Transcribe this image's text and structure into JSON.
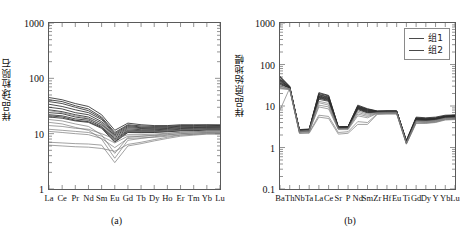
{
  "figure": {
    "panels": [
      {
        "id": "a",
        "caption": "(a)",
        "ylabel": "样品/球粒陨石"
      },
      {
        "id": "b",
        "caption": "(b)",
        "ylabel": "样品/原始地幔"
      }
    ],
    "legend": {
      "items": [
        {
          "label": "组1",
          "color": "#3d3d3d"
        },
        {
          "label": "组2",
          "color": "#6b6b6b"
        }
      ]
    }
  },
  "chart_data": [
    {
      "type": "line",
      "panel": "a",
      "title": "",
      "xlabel": "",
      "ylabel": "样品/球粒陨石",
      "yscale": "log",
      "ylim": [
        1,
        1000
      ],
      "yticks": [
        1,
        10,
        100,
        1000
      ],
      "ytick_labels": [
        "1",
        "10",
        "100",
        "1000"
      ],
      "grid": false,
      "legend_position": "none",
      "categories": [
        "La",
        "Ce",
        "Pr",
        "Nd",
        "Sm",
        "Eu",
        "Gd",
        "Tb",
        "Dy",
        "Ho",
        "Er",
        "Tm",
        "Yb",
        "Lu"
      ],
      "series": [
        {
          "name": "s1",
          "group": "组1",
          "values": [
            45,
            41,
            35,
            31,
            22,
            11.5,
            15.5,
            14.5,
            14.0,
            14.0,
            14.5,
            14.5,
            14.5,
            14.5
          ]
        },
        {
          "name": "s2",
          "group": "组1",
          "values": [
            41,
            38,
            32,
            28,
            20,
            10.5,
            14.5,
            13.8,
            13.5,
            13.6,
            14.0,
            14.0,
            14.2,
            14.0
          ]
        },
        {
          "name": "s3",
          "group": "组1",
          "values": [
            38,
            35,
            30,
            26,
            19,
            10.0,
            14.0,
            13.2,
            13.0,
            13.2,
            13.6,
            13.6,
            13.8,
            13.8
          ]
        },
        {
          "name": "s4",
          "group": "组1",
          "values": [
            34,
            31,
            27,
            24,
            18,
            9.5,
            13.4,
            12.8,
            12.6,
            12.8,
            13.2,
            13.2,
            13.4,
            13.4
          ]
        },
        {
          "name": "s5",
          "group": "组1",
          "values": [
            30,
            28,
            24,
            22,
            16.5,
            9.0,
            12.8,
            12.4,
            12.2,
            12.4,
            12.8,
            12.9,
            13.0,
            13.0
          ]
        },
        {
          "name": "s6",
          "group": "组1",
          "values": [
            27,
            25,
            22,
            20,
            15.5,
            8.5,
            12.2,
            11.8,
            11.8,
            12.0,
            12.4,
            12.5,
            12.7,
            12.6
          ]
        },
        {
          "name": "s7",
          "group": "组1",
          "values": [
            24,
            23,
            20,
            18.5,
            14.5,
            8.0,
            11.6,
            11.3,
            11.3,
            11.6,
            12.0,
            12.1,
            12.3,
            12.2
          ]
        },
        {
          "name": "s8",
          "group": "组1",
          "values": [
            22,
            21,
            18.5,
            17.5,
            13.5,
            7.6,
            11.2,
            11.0,
            11.0,
            11.2,
            11.6,
            11.8,
            12.0,
            12.0
          ]
        },
        {
          "name": "s9",
          "group": "组1",
          "values": [
            21,
            20,
            17.5,
            16.5,
            13.0,
            7.2,
            10.8,
            10.6,
            10.7,
            11.0,
            11.4,
            11.5,
            11.8,
            11.8
          ]
        },
        {
          "name": "s10",
          "group": "组1",
          "values": [
            20,
            19,
            17.0,
            16.0,
            12.5,
            7.0,
            10.5,
            10.4,
            10.5,
            10.8,
            11.2,
            11.3,
            11.6,
            11.6
          ]
        },
        {
          "name": "s11",
          "group": "组2",
          "values": [
            26,
            24,
            21,
            19,
            14.0,
            10.5,
            11.5,
            11.0,
            11.0,
            11.2,
            11.6,
            11.8,
            12.0,
            12.0
          ]
        },
        {
          "name": "s12",
          "group": "组2",
          "values": [
            14,
            13.5,
            12.5,
            12.0,
            10.0,
            8.0,
            9.6,
            9.6,
            9.8,
            10.2,
            10.6,
            10.8,
            11.0,
            11.0
          ]
        },
        {
          "name": "s13",
          "group": "组2",
          "values": [
            12,
            11.5,
            11.0,
            10.5,
            9.0,
            6.8,
            9.0,
            9.0,
            9.2,
            9.6,
            10.0,
            10.2,
            10.5,
            10.4
          ]
        },
        {
          "name": "s14",
          "group": "组2",
          "values": [
            11,
            10.5,
            10.0,
            9.6,
            8.2,
            5.6,
            8.2,
            8.4,
            8.6,
            9.0,
            9.5,
            9.7,
            10.0,
            10.0
          ]
        },
        {
          "name": "s15",
          "group": "组2",
          "values": [
            18,
            17,
            15.0,
            13.5,
            9.5,
            4.4,
            8.6,
            9.0,
            9.4,
            10.0,
            10.6,
            10.8,
            11.2,
            11.2
          ]
        },
        {
          "name": "s16",
          "group": "组2",
          "values": [
            16,
            15,
            13.0,
            11.5,
            8.0,
            3.6,
            7.6,
            8.2,
            8.8,
            9.4,
            10.0,
            10.3,
            10.6,
            10.6
          ]
        },
        {
          "name": "s17",
          "group": "组2",
          "values": [
            7.0,
            6.8,
            6.6,
            6.5,
            6.2,
            3.0,
            6.0,
            6.6,
            7.4,
            8.2,
            9.0,
            9.4,
            9.8,
            9.8
          ]
        },
        {
          "name": "s18",
          "group": "组2",
          "values": [
            6.2,
            6.0,
            5.8,
            5.7,
            5.4,
            4.8,
            6.4,
            7.0,
            7.8,
            8.6,
            9.4,
            9.8,
            10.2,
            10.2
          ]
        }
      ]
    },
    {
      "type": "line",
      "panel": "b",
      "title": "",
      "xlabel": "",
      "ylabel": "样品/原始地幔",
      "yscale": "log",
      "ylim": [
        0.1,
        1000
      ],
      "yticks": [
        0.1,
        1,
        10,
        100,
        1000
      ],
      "ytick_labels": [
        "0.1",
        "1",
        "10",
        "100",
        "1000"
      ],
      "grid": false,
      "legend_position": "top-right",
      "categories": [
        "Ba",
        "Th",
        "Nb",
        "Ta",
        "La",
        "Ce",
        "Sr",
        "P",
        "Nd",
        "Sm",
        "Zr",
        "Hf",
        "Eu",
        "Ti",
        "Gd",
        "Dy",
        "Y",
        "Yb",
        "Lu"
      ],
      "series": [
        {
          "name": "t1",
          "group": "组1",
          "values": [
            52,
            30,
            2.6,
            2.7,
            21,
            18,
            3.1,
            3.2,
            10.5,
            8.6,
            7.6,
            7.6,
            7.6,
            1.45,
            5.2,
            5.0,
            5.2,
            5.8,
            6.0
          ]
        },
        {
          "name": "t2",
          "group": "组1",
          "values": [
            46,
            29,
            2.6,
            2.7,
            19,
            16.5,
            3.1,
            3.2,
            9.8,
            8.2,
            7.4,
            7.5,
            7.5,
            1.4,
            5.0,
            4.8,
            5.0,
            5.6,
            5.8
          ]
        },
        {
          "name": "t3",
          "group": "组1",
          "values": [
            42,
            28,
            2.6,
            2.7,
            17.5,
            15.5,
            3.0,
            3.1,
            9.4,
            7.8,
            7.3,
            7.4,
            7.4,
            1.38,
            4.8,
            4.7,
            4.9,
            5.5,
            5.6
          ]
        },
        {
          "name": "t4",
          "group": "组1",
          "values": [
            38,
            28,
            2.5,
            2.6,
            16.5,
            14.5,
            3.0,
            3.0,
            9.0,
            7.4,
            7.2,
            7.3,
            7.3,
            1.35,
            4.7,
            4.6,
            4.8,
            5.4,
            5.5
          ]
        },
        {
          "name": "t5",
          "group": "组1",
          "values": [
            35,
            27,
            2.5,
            2.6,
            15.5,
            13.5,
            2.9,
            3.0,
            8.6,
            7.0,
            7.1,
            7.2,
            7.2,
            1.32,
            4.6,
            4.5,
            4.7,
            5.3,
            5.4
          ]
        },
        {
          "name": "t6",
          "group": "组1",
          "values": [
            33,
            27,
            2.4,
            2.5,
            14.5,
            13.0,
            2.9,
            2.9,
            8.2,
            6.8,
            7.0,
            7.1,
            7.1,
            1.3,
            4.5,
            4.4,
            4.6,
            5.2,
            5.3
          ]
        },
        {
          "name": "t7",
          "group": "组1",
          "values": [
            50,
            29,
            2.7,
            2.8,
            20,
            17.5,
            3.2,
            3.2,
            10.0,
            8.4,
            7.5,
            7.6,
            7.6,
            1.5,
            5.4,
            5.2,
            5.4,
            6.0,
            6.1
          ]
        },
        {
          "name": "t8",
          "group": "组1",
          "values": [
            44,
            28,
            2.6,
            2.7,
            18.5,
            16.0,
            3.1,
            3.1,
            9.6,
            8.0,
            7.4,
            7.5,
            7.5,
            1.42,
            5.1,
            4.9,
            5.1,
            5.7,
            5.9
          ]
        },
        {
          "name": "t9",
          "group": "组1",
          "values": [
            36,
            27,
            2.5,
            2.6,
            16.0,
            14.0,
            3.0,
            3.0,
            8.8,
            7.2,
            7.2,
            7.3,
            7.3,
            1.36,
            4.9,
            4.7,
            4.9,
            5.5,
            5.7
          ]
        },
        {
          "name": "t10",
          "group": "组1",
          "values": [
            40,
            28,
            2.6,
            2.6,
            17.0,
            15.0,
            3.0,
            3.1,
            9.2,
            7.6,
            7.3,
            7.4,
            7.4,
            1.38,
            5.0,
            4.8,
            5.0,
            5.6,
            5.8
          ]
        },
        {
          "name": "t11",
          "group": "组2",
          "values": [
            30,
            26,
            2.4,
            2.5,
            12.0,
            10.5,
            2.8,
            2.9,
            7.0,
            6.0,
            6.8,
            6.9,
            6.9,
            1.28,
            4.3,
            4.2,
            4.4,
            5.0,
            5.1
          ]
        },
        {
          "name": "t12",
          "group": "组2",
          "values": [
            28,
            26,
            2.3,
            2.4,
            9.5,
            8.5,
            2.7,
            2.7,
            5.8,
            5.2,
            6.6,
            6.7,
            6.7,
            1.25,
            4.1,
            4.0,
            4.2,
            4.8,
            4.9
          ]
        },
        {
          "name": "t13",
          "group": "组2",
          "values": [
            27,
            25,
            2.2,
            2.3,
            6.0,
            5.6,
            2.3,
            2.4,
            4.2,
            4.0,
            6.4,
            6.5,
            6.5,
            1.22,
            3.9,
            3.9,
            4.1,
            4.7,
            4.8
          ]
        },
        {
          "name": "t14",
          "group": "组2",
          "values": [
            26,
            25,
            2.2,
            2.2,
            5.4,
            5.0,
            2.1,
            2.2,
            3.6,
            3.6,
            6.3,
            6.4,
            6.4,
            1.2,
            3.8,
            3.8,
            4.0,
            4.6,
            4.7
          ]
        },
        {
          "name": "t15",
          "group": "组2",
          "values": [
            8.0,
            27,
            2.5,
            2.6,
            13.0,
            11.5,
            2.9,
            2.9,
            7.6,
            6.4,
            7.0,
            7.1,
            7.1,
            1.3,
            4.4,
            4.3,
            4.5,
            5.1,
            5.2
          ]
        },
        {
          "name": "t16",
          "group": "组2",
          "values": [
            31,
            26,
            2.4,
            2.4,
            10.5,
            9.5,
            2.8,
            2.8,
            6.4,
            5.6,
            6.7,
            6.8,
            6.8,
            1.26,
            4.2,
            4.1,
            4.3,
            4.9,
            5.0
          ]
        }
      ]
    }
  ]
}
